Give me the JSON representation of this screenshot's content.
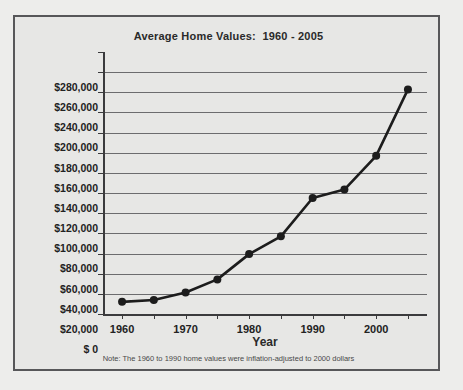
{
  "chart_data": {
    "type": "line",
    "title": "Average Home Values:  1960 - 2005",
    "xlabel": "Year",
    "ylabel": "",
    "footnote": "Note: The 1960 to 1990 home values were inflation-adjusted to 2000 dollars",
    "x": [
      1960,
      1965,
      1970,
      1975,
      1980,
      1985,
      1990,
      1995,
      2000,
      2005
    ],
    "values": [
      13000,
      15000,
      23000,
      37000,
      64000,
      83000,
      124000,
      133000,
      169000,
      240000
    ],
    "xlim": [
      1957,
      2008
    ],
    "ylim": [
      0,
      280000
    ],
    "grid": true,
    "legend": null,
    "marker": "filled-circle",
    "line_color": "#1d1d1d",
    "marker_color": "#1d1d1d",
    "grid_color": "#6d6d6f",
    "ytick_values": [
      280000,
      260000,
      240000,
      200000,
      180000,
      160000,
      140000,
      120000,
      100000,
      80000,
      60000,
      40000,
      20000,
      0
    ],
    "ytick_labels": [
      "$280,000",
      "$260,000",
      "$240,000",
      "$200,000",
      "$180,000",
      "$160,000",
      "$140,000",
      "$120,000",
      "$100,000",
      "$80,000",
      "$60,000",
      "$40,000",
      "$20,000",
      "$ 0"
    ],
    "xtick_values": [
      1960,
      1965,
      1970,
      1975,
      1980,
      1985,
      1990,
      1995,
      2000,
      2005
    ],
    "xtick_labels": [
      "1960",
      "",
      "1970",
      "",
      "1980",
      "",
      "1990",
      "",
      "2000",
      ""
    ]
  }
}
